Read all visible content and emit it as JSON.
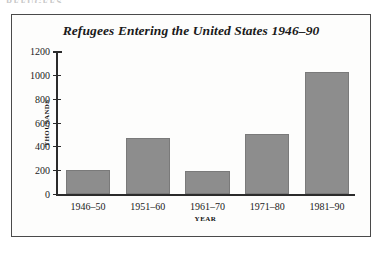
{
  "clipped_header_text": "REFUGEES",
  "figure": {
    "title": "Refugees Entering the United States 1946–90",
    "frame_color": "#4a4a4a",
    "background_color": "#fdfdfc"
  },
  "chart_data": {
    "type": "bar",
    "title": "Refugees Entering the United States 1946–90",
    "xlabel": "YEAR",
    "ylabel": "THOUSANDS",
    "categories": [
      "1946–50",
      "1951–60",
      "1961–70",
      "1971–80",
      "1981–90"
    ],
    "values": [
      200,
      470,
      190,
      500,
      1020
    ],
    "ylim": [
      0,
      1200
    ],
    "yticks": [
      0,
      200,
      400,
      600,
      800,
      1000,
      1200
    ],
    "ytick_labels": [
      "0",
      "200",
      "400",
      "600",
      "800",
      "1000",
      "1200"
    ],
    "grid": false,
    "legend": false,
    "bar_color": "#8d8d8d",
    "bar_edge_color": "#7a7a7a",
    "axis_color": "#2b2b2b"
  }
}
